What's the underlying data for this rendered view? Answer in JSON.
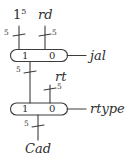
{
  "diagram": {
    "stroke_color": "#3c3c3c",
    "background": "#ffffff",
    "inputs": [
      {
        "label": "1",
        "superscript": "5",
        "width": "5"
      },
      {
        "label": "rd",
        "width": "5"
      },
      {
        "label": "rt",
        "width": "5"
      }
    ],
    "muxes": [
      {
        "port_one": "1",
        "port_zero": "0",
        "select": "jal",
        "output_width": "5"
      },
      {
        "port_one": "1",
        "port_zero": "0",
        "select": "rtype",
        "output_width": "5"
      }
    ],
    "output": {
      "label": "Cad",
      "width": "5"
    }
  }
}
